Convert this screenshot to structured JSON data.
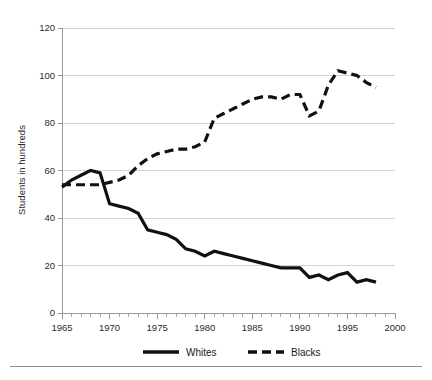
{
  "chart_data": {
    "type": "line",
    "title": "",
    "subtitle": "",
    "xlabel": "",
    "ylabel": "Students in hundreds",
    "xlim": [
      1965,
      2000
    ],
    "ylim": [
      0,
      120
    ],
    "grid": true,
    "legend_position": "bottom",
    "x_ticks": [
      1965,
      1970,
      1975,
      1980,
      1985,
      1990,
      1995,
      2000
    ],
    "x_tick_labels": [
      "1965",
      "1970",
      "1975",
      "1980",
      "1985",
      "1990",
      "1995",
      "2000"
    ],
    "x_minor_tick_step": 1,
    "y_ticks": [
      0,
      20,
      40,
      60,
      80,
      100,
      120
    ],
    "y_tick_labels": [
      "0",
      "20",
      "40",
      "60",
      "80",
      "100",
      "120"
    ],
    "x": [
      1965,
      1966,
      1967,
      1968,
      1969,
      1970,
      1971,
      1972,
      1973,
      1974,
      1975,
      1976,
      1977,
      1978,
      1979,
      1980,
      1981,
      1982,
      1983,
      1984,
      1985,
      1986,
      1987,
      1988,
      1989,
      1990,
      1991,
      1992,
      1993,
      1994,
      1995,
      1996,
      1997,
      1998
    ],
    "series": [
      {
        "name": "Whites",
        "style": "solid",
        "color": "#111111",
        "values": [
          53,
          56,
          58,
          60,
          59,
          46,
          45,
          44,
          42,
          35,
          34,
          33,
          31,
          27,
          26,
          24,
          26,
          25,
          24,
          23,
          22,
          21,
          20,
          19,
          19,
          19,
          15,
          16,
          14,
          16,
          17,
          13,
          14,
          13
        ]
      },
      {
        "name": "Blacks",
        "style": "dashed",
        "color": "#111111",
        "values": [
          54,
          54,
          54,
          54,
          54,
          55,
          56,
          58,
          62,
          65,
          67,
          68,
          69,
          69,
          70,
          72,
          82,
          84,
          86,
          88,
          90,
          91,
          91,
          90,
          92,
          92,
          83,
          85,
          96,
          102,
          101,
          100,
          97,
          95
        ]
      }
    ]
  },
  "legend": {
    "items": [
      {
        "label": "Whites",
        "style": "solid"
      },
      {
        "label": "Blacks",
        "style": "dashed"
      }
    ]
  }
}
